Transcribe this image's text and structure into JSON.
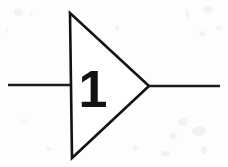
{
  "figure": {
    "kind": "schematic-symbol",
    "width": 228,
    "height": 167,
    "background_color": "#fdfdfd",
    "ink_color": "#121212"
  },
  "symbol": {
    "name": "buffer-gate",
    "label": "1",
    "body": {
      "name": "triangle-body",
      "points": "70,13 72,158 149,86",
      "fill": "#ffffff",
      "stroke": "#121212",
      "stroke_width": 2.6
    },
    "label_position": {
      "x": 93,
      "y": 107
    },
    "label_color": "#121212"
  },
  "wires": [
    {
      "name": "input-wire",
      "x1": 8,
      "y1": 85,
      "x2": 72,
      "y2": 85,
      "stroke": "#1c1c1c",
      "stroke_width": 2.6
    },
    {
      "name": "output-wire",
      "x1": 148,
      "y1": 86,
      "x2": 220,
      "y2": 86,
      "stroke": "#1c1c1c",
      "stroke_width": 2.6
    }
  ],
  "speckles": [
    {
      "x": 14,
      "y": 9,
      "w": 8,
      "h": 7
    },
    {
      "x": 29,
      "y": 12,
      "w": 4,
      "h": 4
    },
    {
      "x": 5,
      "y": 28,
      "w": 3,
      "h": 5
    },
    {
      "x": 186,
      "y": 10,
      "w": 3,
      "h": 9
    },
    {
      "x": 204,
      "y": 6,
      "w": 9,
      "h": 6
    },
    {
      "x": 216,
      "y": 26,
      "w": 5,
      "h": 4
    },
    {
      "x": 199,
      "y": 31,
      "w": 6,
      "h": 5
    },
    {
      "x": 178,
      "y": 118,
      "w": 10,
      "h": 8
    },
    {
      "x": 192,
      "y": 126,
      "w": 14,
      "h": 10
    },
    {
      "x": 170,
      "y": 133,
      "w": 7,
      "h": 6
    },
    {
      "x": 201,
      "y": 146,
      "w": 6,
      "h": 8
    },
    {
      "x": 161,
      "y": 151,
      "w": 9,
      "h": 5
    },
    {
      "x": 46,
      "y": 147,
      "w": 5,
      "h": 4
    },
    {
      "x": 22,
      "y": 119,
      "w": 4,
      "h": 3
    },
    {
      "x": 115,
      "y": 26,
      "w": 4,
      "h": 4
    },
    {
      "x": 133,
      "y": 146,
      "w": 5,
      "h": 5
    }
  ]
}
